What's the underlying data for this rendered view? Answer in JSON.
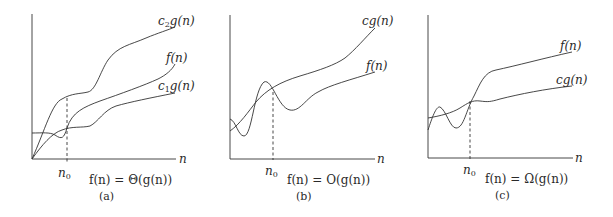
{
  "panels": [
    {
      "id": "a",
      "caption": "(a)",
      "equation": "f(n) = Θ(g(n))",
      "x_axis_label": "n",
      "threshold_label": "n0",
      "curves": [
        {
          "name": "c2g(n)",
          "label_main": "c",
          "label_sub": "2",
          "label_rest": "g(n)"
        },
        {
          "name": "f(n)",
          "label_main": "f(n)"
        },
        {
          "name": "c1g(n)",
          "label_main": "c",
          "label_sub": "1",
          "label_rest": "g(n)"
        }
      ]
    },
    {
      "id": "b",
      "caption": "(b)",
      "equation": "f(n) = O(g(n))",
      "x_axis_label": "n",
      "threshold_label": "n0",
      "curves": [
        {
          "name": "cg(n)",
          "label_main": "cg(n)"
        },
        {
          "name": "f(n)",
          "label_main": "f(n)"
        }
      ]
    },
    {
      "id": "c",
      "caption": "(c)",
      "equation": "f(n) = Ω(g(n))",
      "x_axis_label": "n",
      "threshold_label": "n0",
      "curves": [
        {
          "name": "f(n)",
          "label_main": "f(n)"
        },
        {
          "name": "cg(n)",
          "label_main": "cg(n)"
        }
      ]
    }
  ],
  "threshold_sub": "0",
  "threshold_base": "n"
}
